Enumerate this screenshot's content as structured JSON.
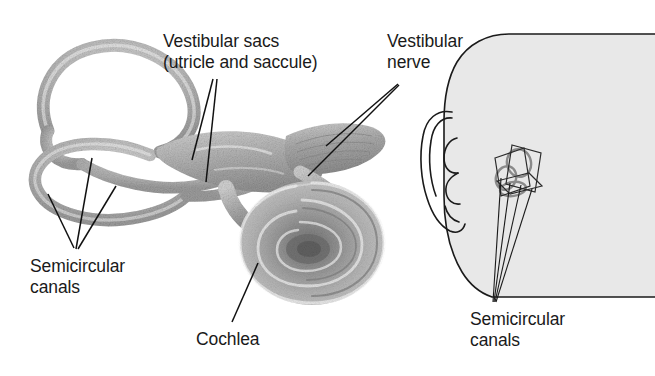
{
  "figure": {
    "background_color": "#ffffff",
    "text_color": "#1a1a1a",
    "width": 655,
    "height": 376
  },
  "labels": {
    "vestibular_sacs": {
      "line1": "Vestibular sacs",
      "line2": "(utricle and saccule)"
    },
    "vestibular_nerve": {
      "line1": "Vestibular",
      "line2": "nerve"
    },
    "semicircular_canals_left": {
      "line1": "Semicircular",
      "line2": "canals"
    },
    "cochlea": {
      "line1": "Cochlea"
    },
    "semicircular_canals_right": {
      "line1": "Semicircular",
      "line2": "canals"
    }
  },
  "structures": {
    "labyrinth": {
      "name": "bony labyrinth",
      "fill_color": "#b8b8b8",
      "parts": [
        "superior semicircular canal",
        "posterior semicircular canal",
        "lateral semicircular canal",
        "vestibule",
        "vestibular nerve",
        "cochlea"
      ]
    },
    "cochlea": {
      "name": "cochlear spiral",
      "turns": 2.5,
      "center_color": "#6d6d6d",
      "outer_color": "#bdbdbd"
    },
    "head_inset": {
      "name": "head profile facing left",
      "fill_color": "#e8e8e8",
      "outline_color": "#1a1a1a",
      "features": [
        "scalp",
        "forehead",
        "ear",
        "jaw",
        "neck"
      ]
    },
    "canal_planes": {
      "name": "three orthogonal semicircular canal planes",
      "plane_count": 3,
      "loop_color": "#8a8a8a",
      "edge_color": "#2b2b2b"
    }
  },
  "leader_lines": {
    "vestibular_sacs_count": 2,
    "vestibular_nerve_count": 2,
    "semicircular_canals_left_count": 3,
    "cochlea_count": 1,
    "semicircular_canals_right_count": 4,
    "color": "#111111"
  }
}
